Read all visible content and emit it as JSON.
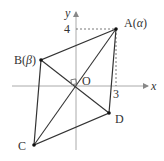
{
  "diagram": {
    "axes": {
      "x_label": "x",
      "y_label": "y",
      "origin_label": "O",
      "tick_x": "3",
      "tick_y": "4"
    },
    "points": {
      "A": {
        "label": "A",
        "arg": "α",
        "coords": [
          3,
          4
        ]
      },
      "B": {
        "label": "B",
        "arg": "β"
      },
      "C": {
        "label": "C"
      },
      "D": {
        "label": "D"
      }
    },
    "colors": {
      "axis": "#999999",
      "line": "#333333",
      "dash": "#555555"
    }
  }
}
